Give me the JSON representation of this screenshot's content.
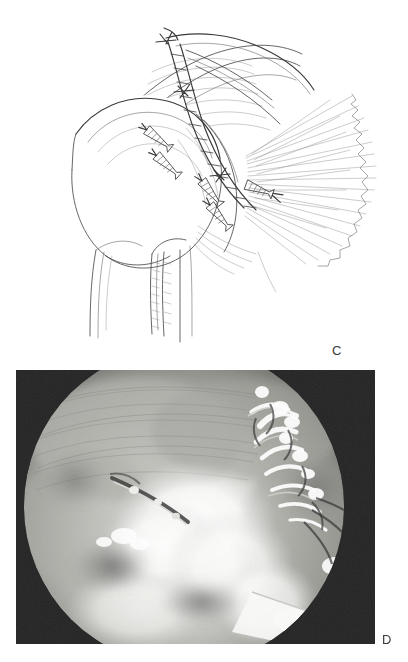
{
  "figure": {
    "running_head": ". . .",
    "background_color": "#ffffff",
    "ink_color": "#3a3a3a"
  },
  "panels": [
    {
      "id": "C",
      "label": "C",
      "type": "line-drawing",
      "subject": "arthroscopic rotator cuff repair, anterior view of proximal humerus",
      "label_position": {
        "x": 332,
        "y": 343
      },
      "bounds": {
        "x": 0,
        "y": 0,
        "width": 408,
        "height": 362
      },
      "anatomy": [
        "humeral head",
        "greater tuberosity",
        "bicipital groove",
        "humeral shaft",
        "rotator cuff tendon with radiating fibers",
        "torn tendon edge"
      ],
      "hardware": [
        "suture anchor",
        "suture anchor",
        "suture anchor",
        "suture anchor",
        "suture anchor",
        "suture bridge",
        "suture knot",
        "suture knot"
      ]
    },
    {
      "id": "D",
      "label": "D",
      "type": "arthroscopic-photograph",
      "subject": "arthroscopic view of completed cuff repair with suture bridge",
      "label_position": {
        "x": 382,
        "y": 632
      },
      "bounds": {
        "x": 16,
        "y": 370,
        "width": 359,
        "height": 274
      },
      "vignette_color": "#242424",
      "tissue_highlight_color": "#f2f2f0",
      "tissue_midtone_color": "#a8a8a4"
    }
  ]
}
